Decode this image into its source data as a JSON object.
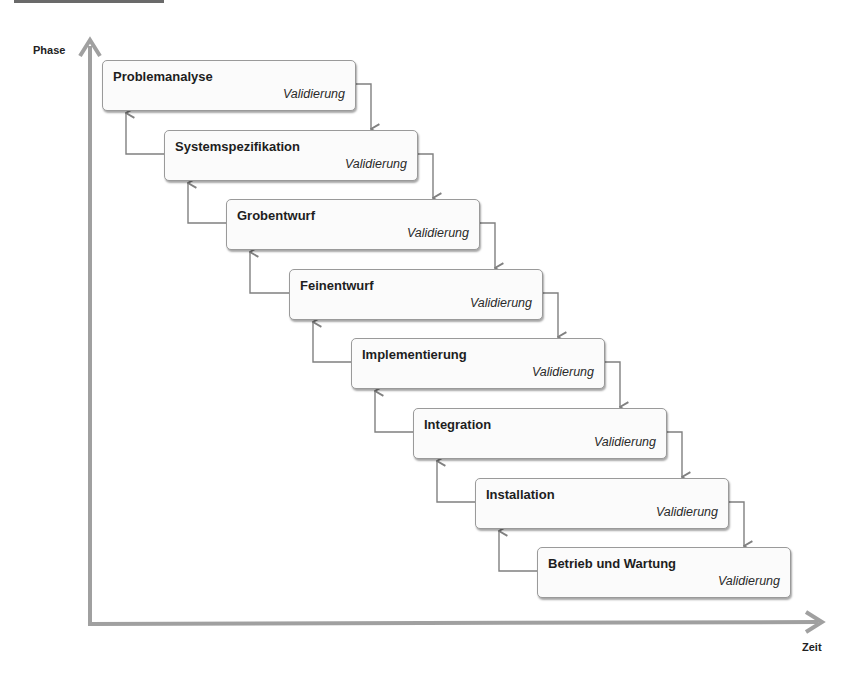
{
  "diagram": {
    "type": "waterfall-model",
    "axes": {
      "y_label": "Phase",
      "x_label": "Zeit"
    },
    "phases": [
      {
        "title": "Problemanalyse",
        "subtitle": "Validierung"
      },
      {
        "title": "Systemspezifikation",
        "subtitle": "Validierung"
      },
      {
        "title": "Grobentwurf",
        "subtitle": "Validierung"
      },
      {
        "title": "Feinentwurf",
        "subtitle": "Validierung"
      },
      {
        "title": "Implementierung",
        "subtitle": "Validierung"
      },
      {
        "title": "Integration",
        "subtitle": "Validierung"
      },
      {
        "title": "Installation",
        "subtitle": "Validierung"
      },
      {
        "title": "Betrieb und Wartung",
        "subtitle": "Validierung"
      }
    ],
    "colors": {
      "axis": "#a0a0a0",
      "connector": "#808080",
      "box_border": "#9a9a9a",
      "box_fill": "#fbfbfb"
    }
  }
}
